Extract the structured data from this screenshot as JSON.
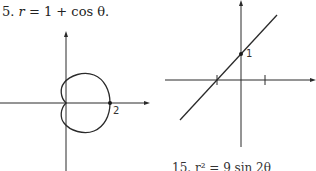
{
  "problem": {
    "number": "5.",
    "equation_lhs": "r",
    "equation_rhs": "= 1 + cos θ."
  },
  "left_plot": {
    "type": "polar-cardioid",
    "point_label": "2"
  },
  "right_plot": {
    "type": "line",
    "point_label": "1"
  },
  "bottom_cut_text": "15.  r²  =  9 sin 2θ"
}
